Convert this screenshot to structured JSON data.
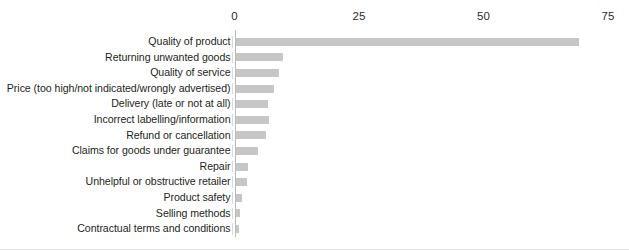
{
  "chart_data": {
    "type": "bar",
    "orientation": "horizontal",
    "title": "",
    "subtitle": "",
    "xlabel": "",
    "ylabel": "",
    "xlim": [
      0,
      75
    ],
    "xticks": [
      0,
      25,
      50,
      75
    ],
    "xtick_labels": [
      "0",
      "25",
      "50",
      "75"
    ],
    "grid": false,
    "legend": null,
    "bar_color": "#c6c6c6",
    "axis_color": "#b9babc",
    "text_color": "#231f20",
    "categories": [
      "Quality of product",
      "Returning unwanted goods",
      "Quality of service",
      "Price (too high/not indicated/wrongly advertised)",
      "Delivery (late or not at all)",
      "Incorrect labelling/information",
      "Refund or cancellation",
      "Claims for goods under guarantee",
      "Repair",
      "Unhelpful or obstructive retailer",
      "Product safety",
      "Selling methods",
      "Contractual terms and conditions"
    ],
    "values": [
      69,
      9.6,
      8.8,
      7.7,
      6.6,
      6.8,
      6.2,
      4.6,
      2.6,
      2.4,
      1.3,
      0.9,
      0.8
    ]
  },
  "fragment": {
    "top_clipped_text": " "
  }
}
